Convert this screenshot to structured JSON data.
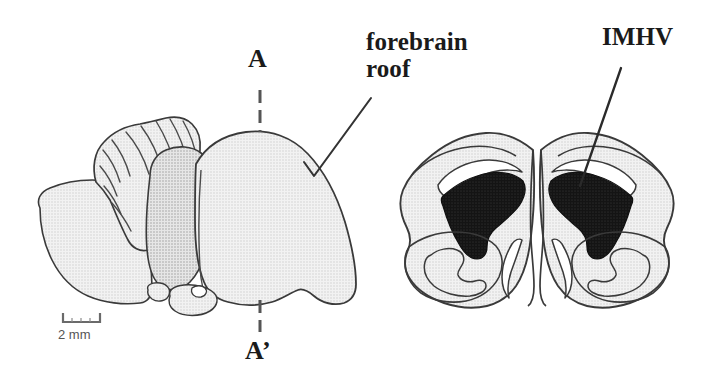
{
  "figure": {
    "kind": "anatomical-diagram",
    "background_color": "#ffffff",
    "width": 718,
    "height": 389
  },
  "labels": {
    "forebrain_roof": "forebrain\nroof",
    "imhv": "IMHV",
    "section_plane_top": "A",
    "section_plane_bottom": "A’",
    "scale_bar": "2 mm"
  },
  "panels": {
    "left": {
      "name": "sagittal-lateral-view",
      "description": "Lateral (sagittal) view of whole brain showing cerebellum and forebrain",
      "structures": [
        "cerebellum",
        "optic tectum",
        "forebrain",
        "brainstem",
        "pituitary"
      ]
    },
    "right": {
      "name": "coronal-section",
      "description": "Coronal section at plane A-A' showing bilateral IMHV regions",
      "structures": [
        "left hemisphere",
        "right hemisphere",
        "left IMHV",
        "right IMHV",
        "lateral ventricles",
        "basal ganglia"
      ]
    }
  },
  "colors": {
    "outline": "#3a3a3a",
    "tissue_fill": "#ececec",
    "tissue_fill_dark": "#dedede",
    "imhv_fill": "#1c1c1c",
    "ventricle_fill": "#ffffff",
    "label_text": "#1a1a1a",
    "scale_text": "#555555",
    "leader_line": "#333333",
    "plane_line": "#555555"
  },
  "annotations": {
    "leader_forebrain_roof": "polyline from forebrain roof label down-left then to brain surface",
    "leader_imhv": "straight line from IMHV label down-left into right IMHV region",
    "plane_line_style": "dashed vertical line marking coronal plane A-A'"
  }
}
